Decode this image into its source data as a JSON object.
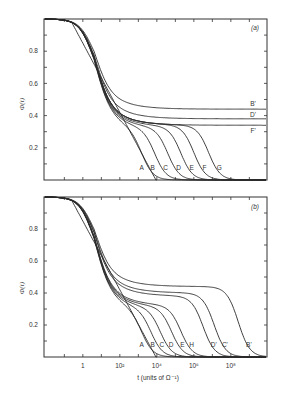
{
  "chart_data": [
    {
      "panel": "(a)",
      "type": "line",
      "xscale": "log",
      "xlabel": "t (units of Ω⁻¹)",
      "ylabel": "Φ(t)",
      "ylim": [
        0,
        1.0
      ],
      "xlim_log10": [
        -2.1,
        10
      ],
      "x_tick_labels": [],
      "y_tick_labels": [
        "0.2",
        "0.4",
        "0.6",
        "0.8"
      ],
      "y_ticks": [
        0.2,
        0.4,
        0.6,
        0.8
      ],
      "grid": false,
      "series": [
        {
          "name": "A",
          "plateau": 0.0,
          "cutoff_log10": 3.5,
          "label_x_log10": 3.5
        },
        {
          "name": "B",
          "plateau": 0.3,
          "cutoff_log10": 4.1,
          "label_x_log10": 4.1
        },
        {
          "name": "C",
          "plateau": 0.31,
          "cutoff_log10": 4.8,
          "label_x_log10": 4.8
        },
        {
          "name": "D",
          "plateau": 0.32,
          "cutoff_log10": 5.5,
          "label_x_log10": 5.5
        },
        {
          "name": "E",
          "plateau": 0.33,
          "cutoff_log10": 6.2,
          "label_x_log10": 6.2
        },
        {
          "name": "F",
          "plateau": 0.34,
          "cutoff_log10": 6.9,
          "label_x_log10": 6.9
        },
        {
          "name": "G",
          "plateau": 0.34,
          "cutoff_log10": 7.7,
          "label_x_log10": 7.7
        },
        {
          "name": "F'",
          "plateau": 0.34,
          "cutoff_log10": null,
          "label_x_log10": 9.2
        },
        {
          "name": "D'",
          "plateau": 0.38,
          "cutoff_log10": null,
          "label_x_log10": 9.2
        },
        {
          "name": "B'",
          "plateau": 0.44,
          "cutoff_log10": null,
          "label_x_log10": 9.2
        }
      ]
    },
    {
      "panel": "(b)",
      "type": "line",
      "xscale": "log",
      "xlabel": "t (units of Ω⁻¹)",
      "ylabel": "Φ(t)",
      "ylim": [
        0,
        1.0
      ],
      "xlim_log10": [
        -2.1,
        10
      ],
      "x_tick_labels": [
        "1",
        "10²",
        "10⁴",
        "10⁶",
        "10⁸"
      ],
      "x_ticks_log10": [
        0,
        2,
        4,
        6,
        8
      ],
      "y_tick_labels": [
        "0.2",
        "0.4",
        "0.6",
        "0.8"
      ],
      "y_ticks": [
        0.2,
        0.4,
        0.6,
        0.8
      ],
      "grid": false,
      "series": [
        {
          "name": "A",
          "plateau": 0.0,
          "cutoff_log10": 3.5
        },
        {
          "name": "B",
          "plateau": 0.28,
          "cutoff_log10": 4.1
        },
        {
          "name": "C",
          "plateau": 0.29,
          "cutoff_log10": 4.6
        },
        {
          "name": "D",
          "plateau": 0.3,
          "cutoff_log10": 5.1
        },
        {
          "name": "E",
          "plateau": 0.31,
          "cutoff_log10": 5.7
        },
        {
          "name": "H",
          "plateau": 0.32,
          "cutoff_log10": 6.2
        },
        {
          "name": "D'",
          "plateau": 0.38,
          "cutoff_log10": 7.4
        },
        {
          "name": "C'",
          "plateau": 0.4,
          "cutoff_log10": 8.0
        },
        {
          "name": "B'",
          "plateau": 0.44,
          "cutoff_log10": 9.3
        }
      ]
    }
  ],
  "panels": {
    "a": {
      "tag": "(a)"
    },
    "b": {
      "tag": "(b)"
    }
  },
  "axes": {
    "ylabel": "Φ(t)",
    "xlabel": "t (units of Ω⁻¹)",
    "yticks": [
      "0.2",
      "0.4",
      "0.6",
      "0.8"
    ],
    "xticks": [
      "1",
      "10²",
      "10⁴",
      "10⁶",
      "10⁸"
    ]
  }
}
